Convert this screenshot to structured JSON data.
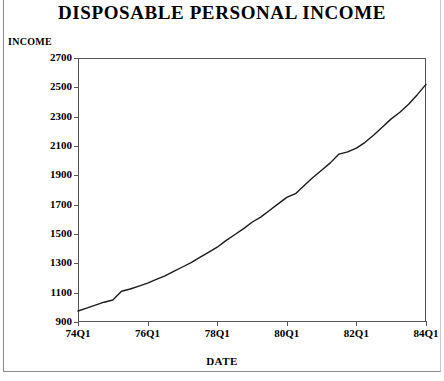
{
  "chart_data": {
    "type": "line",
    "title": "DISPOSABLE PERSONAL INCOME",
    "xlabel": "DATE",
    "ylabel": "INCOME",
    "grid": false,
    "legend": null,
    "xlim": [
      "74Q1",
      "84Q1"
    ],
    "ylim": [
      900,
      2700
    ],
    "ytick_step": 200,
    "ytick_labels": [
      "2700",
      "2500",
      "2300",
      "2100",
      "1900",
      "1700",
      "1500",
      "1300",
      "1100",
      "900"
    ],
    "ytick_values": [
      2700,
      2500,
      2300,
      2100,
      1900,
      1700,
      1500,
      1300,
      1100,
      900
    ],
    "xtick_labels": [
      "74Q1",
      "76Q1",
      "78Q1",
      "80Q1",
      "82Q1",
      "84Q1"
    ],
    "xtick_values": [
      "74Q1",
      "76Q1",
      "78Q1",
      "80Q1",
      "82Q1",
      "84Q1"
    ],
    "line_color": "#1a1a1a",
    "x": [
      "74Q1",
      "74Q2",
      "74Q3",
      "74Q4",
      "75Q1",
      "75Q2",
      "75Q3",
      "75Q4",
      "76Q1",
      "76Q2",
      "76Q3",
      "76Q4",
      "77Q1",
      "77Q2",
      "77Q3",
      "77Q4",
      "78Q1",
      "78Q2",
      "78Q3",
      "78Q4",
      "79Q1",
      "79Q2",
      "79Q3",
      "79Q4",
      "80Q1",
      "80Q2",
      "80Q3",
      "80Q4",
      "81Q1",
      "81Q2",
      "81Q3",
      "81Q4",
      "82Q1",
      "82Q2",
      "82Q3",
      "82Q4",
      "83Q1",
      "83Q2",
      "83Q3",
      "83Q4",
      "84Q1"
    ],
    "values": [
      975,
      995,
      1015,
      1035,
      1050,
      1110,
      1125,
      1145,
      1165,
      1190,
      1215,
      1245,
      1275,
      1305,
      1340,
      1375,
      1410,
      1455,
      1495,
      1535,
      1580,
      1615,
      1660,
      1705,
      1750,
      1775,
      1830,
      1885,
      1935,
      1985,
      2045,
      2060,
      2085,
      2125,
      2175,
      2230,
      2285,
      2330,
      2385,
      2450,
      2520
    ],
    "series": [
      {
        "name": "Disposable Personal Income",
        "values": [
          975,
          995,
          1015,
          1035,
          1050,
          1110,
          1125,
          1145,
          1165,
          1190,
          1215,
          1245,
          1275,
          1305,
          1340,
          1375,
          1410,
          1455,
          1495,
          1535,
          1580,
          1615,
          1660,
          1705,
          1750,
          1775,
          1830,
          1885,
          1935,
          1985,
          2045,
          2060,
          2085,
          2125,
          2175,
          2230,
          2285,
          2330,
          2385,
          2450,
          2520
        ]
      }
    ]
  }
}
